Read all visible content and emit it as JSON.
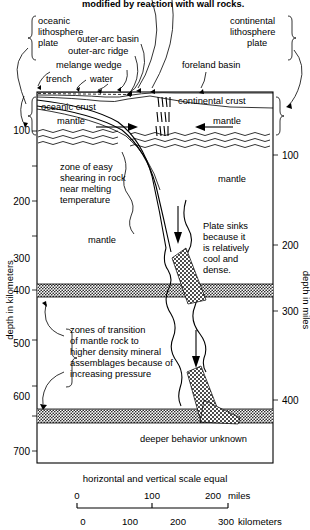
{
  "figure": {
    "top_caption": "modified by reaction with wall rocks.",
    "scale_note": "horizontal and vertical scale equal"
  },
  "brackets": {
    "left": {
      "line1": "oceanic",
      "line2": "lithosphere",
      "line3": "plate"
    },
    "right": {
      "line1": "continental",
      "line2": "lithosphere",
      "line3": "plate"
    }
  },
  "surface_labels": {
    "outer_arc_basin": "outer-arc basin",
    "outer_arc_ridge": "outer-arc ridge",
    "melange_wedge": "melange wedge",
    "trench": "trench",
    "water": "water",
    "foreland_basin": "foreland basin"
  },
  "crust_labels": {
    "oceanic_crust": "oceanic crust",
    "continental_crust": "continental crust",
    "mantle_left": "mantle",
    "mantle_right": "mantle"
  },
  "interior_labels": {
    "shear_zone": [
      "zone of easy",
      "shearing in rock",
      "near melting",
      "temperature"
    ],
    "mantle_left_mid": "mantle",
    "mantle_right_mid": "mantle",
    "plate_sinks": [
      "Plate sinks",
      "because it",
      "is relatively",
      "cool and",
      "dense."
    ],
    "transition_zones": [
      "zones of transition",
      "of mantle rock to",
      "higher density mineral",
      "assemblages because of",
      "increasing pressure"
    ],
    "deeper_unknown": "deeper behavior unknown"
  },
  "axes": {
    "left": {
      "title": "depth in kilometers",
      "ticks": [
        {
          "label": "100",
          "depth_km": 100
        },
        {
          "label": "200",
          "depth_km": 200
        },
        {
          "label": "300",
          "depth_km": 300
        },
        {
          "label": "400",
          "depth_km": 400
        },
        {
          "label": "500",
          "depth_km": 500
        },
        {
          "label": "600",
          "depth_km": 600
        },
        {
          "label": "700",
          "depth_km": 700
        }
      ]
    },
    "right": {
      "title": "depth in miles",
      "ticks": [
        {
          "label": "100",
          "depth_mi": 100
        },
        {
          "label": "200",
          "depth_mi": 200
        },
        {
          "label": "300",
          "depth_mi": 300
        },
        {
          "label": "400",
          "depth_mi": 400
        }
      ]
    }
  },
  "scalebar": {
    "miles": {
      "ticks": [
        "0",
        "100",
        "200"
      ],
      "unit": "miles"
    },
    "kilometers": {
      "ticks": [
        "0",
        "100",
        "200",
        "300"
      ],
      "unit": "kilometers"
    }
  },
  "colors": {
    "ink": "#000000",
    "paper": "#ffffff"
  }
}
